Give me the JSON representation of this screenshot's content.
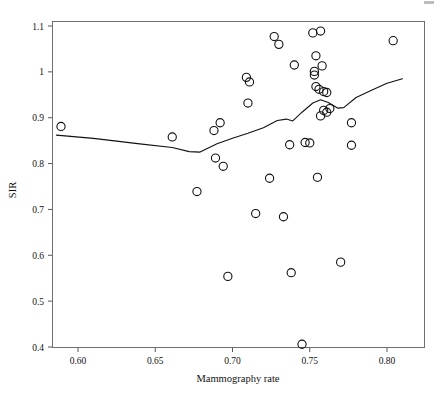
{
  "chart_data": {
    "type": "scatter",
    "title": "",
    "subtitle": "",
    "xlabel": "Mammography rate",
    "ylabel": "SIR",
    "xlim": [
      0.578,
      0.813
    ],
    "ylim": [
      0.393,
      1.122
    ],
    "xticks": [
      0.6,
      0.65,
      0.7,
      0.75,
      0.8
    ],
    "xtick_labels": [
      "0.60",
      "0.65",
      "0.70",
      "0.75",
      "0.80"
    ],
    "yticks": [
      0.4,
      0.5,
      0.6,
      0.7,
      0.8,
      0.9,
      1.0,
      1.1
    ],
    "ytick_labels": [
      "0.4",
      "0.5",
      "0.6",
      "0.7",
      "0.8",
      "0.9",
      "1",
      "1.1"
    ],
    "grid": false,
    "legend": null,
    "marker": "open-circle",
    "marker_color": "#111111",
    "points": [
      {
        "x": 0.589,
        "y": 0.881
      },
      {
        "x": 0.661,
        "y": 0.858
      },
      {
        "x": 0.677,
        "y": 0.739
      },
      {
        "x": 0.688,
        "y": 0.872
      },
      {
        "x": 0.689,
        "y": 0.812
      },
      {
        "x": 0.692,
        "y": 0.889
      },
      {
        "x": 0.694,
        "y": 0.794
      },
      {
        "x": 0.697,
        "y": 0.554
      },
      {
        "x": 0.709,
        "y": 0.988
      },
      {
        "x": 0.71,
        "y": 0.932
      },
      {
        "x": 0.711,
        "y": 0.978
      },
      {
        "x": 0.715,
        "y": 0.691
      },
      {
        "x": 0.724,
        "y": 0.768
      },
      {
        "x": 0.727,
        "y": 1.077
      },
      {
        "x": 0.73,
        "y": 1.06
      },
      {
        "x": 0.733,
        "y": 0.684
      },
      {
        "x": 0.737,
        "y": 0.841
      },
      {
        "x": 0.738,
        "y": 0.562
      },
      {
        "x": 0.74,
        "y": 1.015
      },
      {
        "x": 0.745,
        "y": 0.406
      },
      {
        "x": 0.747,
        "y": 0.846
      },
      {
        "x": 0.75,
        "y": 0.845
      },
      {
        "x": 0.752,
        "y": 1.085
      },
      {
        "x": 0.753,
        "y": 1.001
      },
      {
        "x": 0.753,
        "y": 0.993
      },
      {
        "x": 0.754,
        "y": 1.035
      },
      {
        "x": 0.754,
        "y": 0.968
      },
      {
        "x": 0.755,
        "y": 0.77
      },
      {
        "x": 0.756,
        "y": 0.962
      },
      {
        "x": 0.757,
        "y": 1.089
      },
      {
        "x": 0.757,
        "y": 0.904
      },
      {
        "x": 0.758,
        "y": 1.013
      },
      {
        "x": 0.759,
        "y": 0.957
      },
      {
        "x": 0.759,
        "y": 0.916
      },
      {
        "x": 0.761,
        "y": 0.955
      },
      {
        "x": 0.761,
        "y": 0.912
      },
      {
        "x": 0.763,
        "y": 0.92
      },
      {
        "x": 0.77,
        "y": 0.585
      },
      {
        "x": 0.777,
        "y": 0.889
      },
      {
        "x": 0.777,
        "y": 0.84
      },
      {
        "x": 0.804,
        "y": 1.068
      }
    ],
    "trend_line": {
      "name": "lowess smoother",
      "color": "#111111",
      "points": [
        {
          "x": 0.586,
          "y": 0.862
        },
        {
          "x": 0.61,
          "y": 0.855
        },
        {
          "x": 0.64,
          "y": 0.843
        },
        {
          "x": 0.661,
          "y": 0.835
        },
        {
          "x": 0.672,
          "y": 0.826
        },
        {
          "x": 0.679,
          "y": 0.825
        },
        {
          "x": 0.69,
          "y": 0.843
        },
        {
          "x": 0.7,
          "y": 0.855
        },
        {
          "x": 0.71,
          "y": 0.866
        },
        {
          "x": 0.72,
          "y": 0.878
        },
        {
          "x": 0.729,
          "y": 0.894
        },
        {
          "x": 0.735,
          "y": 0.897
        },
        {
          "x": 0.739,
          "y": 0.893
        },
        {
          "x": 0.745,
          "y": 0.912
        },
        {
          "x": 0.752,
          "y": 0.932
        },
        {
          "x": 0.757,
          "y": 0.939
        },
        {
          "x": 0.762,
          "y": 0.933
        },
        {
          "x": 0.768,
          "y": 0.921
        },
        {
          "x": 0.772,
          "y": 0.922
        },
        {
          "x": 0.78,
          "y": 0.944
        },
        {
          "x": 0.79,
          "y": 0.96
        },
        {
          "x": 0.8,
          "y": 0.975
        },
        {
          "x": 0.81,
          "y": 0.985
        }
      ]
    }
  }
}
